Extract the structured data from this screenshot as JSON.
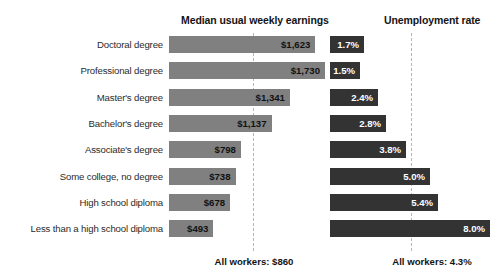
{
  "headers": {
    "earnings": "Median usual weekly earnings",
    "unemployment": "Unemployment rate"
  },
  "footnotes": {
    "earnings": "All workers: $860",
    "unemployment": "All workers: 4.3%"
  },
  "colors": {
    "earnings_bar": "#808080",
    "unemployment_bar": "#333333",
    "reference_line": "#b6b6b6",
    "background": "#ffffff",
    "earnings_label_text": "#111111",
    "unemployment_label_text": "#ffffff"
  },
  "rows": [
    {
      "category": "Doctoral degree",
      "earnings_label": "$1,623",
      "unemployment_label": "1.7%"
    },
    {
      "category": "Professional degree",
      "earnings_label": "$1,730",
      "unemployment_label": "1.5%"
    },
    {
      "category": "Master's degree",
      "earnings_label": "$1,341",
      "unemployment_label": "2.4%"
    },
    {
      "category": "Bachelor's degree",
      "earnings_label": "$1,137",
      "unemployment_label": "2.8%"
    },
    {
      "category": "Associate's degree",
      "earnings_label": "$798",
      "unemployment_label": "3.8%"
    },
    {
      "category": "Some college, no degree",
      "earnings_label": "$738",
      "unemployment_label": "5.0%"
    },
    {
      "category": "High school diploma",
      "earnings_label": "$678",
      "unemployment_label": "5.4%"
    },
    {
      "category": "Less than a high school diploma",
      "earnings_label": "$493",
      "unemployment_label": "8.0%"
    }
  ],
  "chart_data": {
    "type": "bar",
    "title": "",
    "orientation": "horizontal",
    "categories": [
      "Doctoral degree",
      "Professional degree",
      "Master's degree",
      "Bachelor's degree",
      "Associate's degree",
      "Some college, no degree",
      "High school diploma",
      "Less than a high school diploma"
    ],
    "series": [
      {
        "name": "Median usual weekly earnings",
        "unit": "USD per week",
        "values": [
          1623,
          1730,
          1341,
          1137,
          798,
          738,
          678,
          493
        ],
        "value_labels": [
          "$1,623",
          "$1,730",
          "$1,341",
          "$1,137",
          "$798",
          "$738",
          "$678",
          "$493"
        ],
        "color": "#808080",
        "xlim": [
          0,
          1730
        ],
        "reference_line": {
          "label": "All workers: $860",
          "value": 860
        }
      },
      {
        "name": "Unemployment rate",
        "unit": "percent",
        "values": [
          1.7,
          1.5,
          2.4,
          2.8,
          3.8,
          5.0,
          5.4,
          8.0
        ],
        "value_labels": [
          "1.7%",
          "1.5%",
          "2.4%",
          "2.8%",
          "3.8%",
          "5.0%",
          "5.4%",
          "8.0%"
        ],
        "color": "#333333",
        "xlim": [
          0,
          8.0
        ],
        "reference_line": {
          "label": "All workers: 4.3%",
          "value": 4.3
        }
      }
    ],
    "xlabel": "",
    "ylabel": "",
    "grid": false,
    "legend": "none",
    "axis_ticks": false
  }
}
